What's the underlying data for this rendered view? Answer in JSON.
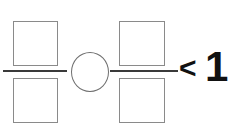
{
  "problem": {
    "type": "fraction-comparison-fill-in",
    "expression_reading": "[ ] / [ ]  ( )  [ ] / [ ]  < 1",
    "left_fraction": {
      "name": "left-fraction",
      "numerator_value": "",
      "denominator_value": "",
      "numerator_placeholder": "",
      "denominator_placeholder": ""
    },
    "operator": {
      "name": "operator-placeholder",
      "shape": "circle",
      "value": ""
    },
    "right_fraction": {
      "name": "right-fraction",
      "numerator_value": "",
      "denominator_value": "",
      "numerator_placeholder": "",
      "denominator_placeholder": ""
    },
    "relation": {
      "comparison_symbol": "<",
      "comparison_value": "1"
    }
  },
  "colors": {
    "background": "#ffffff",
    "box_outline": "#8a8a8a",
    "fraction_bar": "#3a3a3a",
    "circle_outline": "#6f6f6f",
    "text": "#111111"
  }
}
